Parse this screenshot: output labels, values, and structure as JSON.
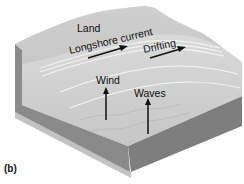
{
  "figure": {
    "panel_label": "(b)",
    "labels": {
      "land": "Land",
      "longshore_current": "Longshore current",
      "drifting": "Drifting",
      "wind": "Wind",
      "waves": "Waves"
    },
    "colors": {
      "land_top": "#c8c8c8",
      "water_top": "#d6d6d6",
      "front_face": "#8e8e8e",
      "side_face": "#7a7a7a",
      "arrow": "#111111"
    }
  }
}
